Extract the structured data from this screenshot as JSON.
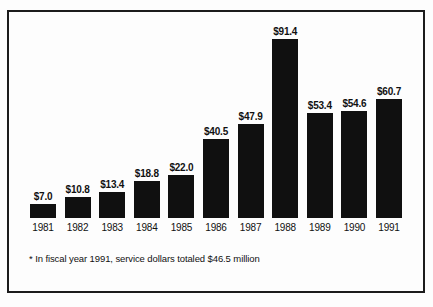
{
  "title_fragment": "",
  "chart_data": {
    "type": "bar",
    "title": "",
    "subtitle": "",
    "xlabel": "",
    "ylabel": "",
    "ylim": [
      0,
      91.4
    ],
    "grid": false,
    "legend": "none",
    "axis_line": "baseline-only",
    "bar_color": "#101010",
    "background_color": "#fdfdfd",
    "border_color": "#1c1c1c",
    "categories": [
      "1981",
      "1982",
      "1983",
      "1984",
      "1985",
      "1986",
      "1987",
      "1988",
      "1989",
      "1990",
      "1991"
    ],
    "values": [
      7.0,
      10.8,
      13.4,
      18.8,
      22.0,
      40.5,
      47.9,
      91.4,
      53.4,
      54.6,
      60.7
    ],
    "value_labels": [
      "$7.0",
      "$10.8",
      "$13.4",
      "$18.8",
      "$22.0",
      "$40.5",
      "$47.9",
      "$91.4",
      "$53.4",
      "$54.6",
      "$60.7"
    ],
    "annotations": [
      "* In fiscal year 1991, service dollars totaled $46.5 million"
    ]
  },
  "footnote": "* In fiscal year 1991, service dollars totaled $46.5 million"
}
